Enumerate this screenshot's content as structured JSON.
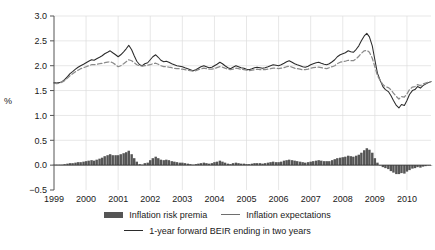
{
  "chart_data": {
    "type": "line",
    "title": "",
    "xlabel": "",
    "ylabel": "%",
    "ylim": [
      -0.5,
      3.0
    ],
    "yticks": [
      "-0.5",
      "0.0",
      "0.5",
      "1.0",
      "1.5",
      "2.0",
      "2.5",
      "3.0"
    ],
    "ytick_values": [
      -0.5,
      0.0,
      0.5,
      1.0,
      1.5,
      2.0,
      2.5,
      3.0
    ],
    "xticks": [
      "1999",
      "2000",
      "2001",
      "2002",
      "2003",
      "2004",
      "2005",
      "2006",
      "2007",
      "2008",
      "2009",
      "2010"
    ],
    "xtick_values": [
      1999,
      2000,
      2001,
      2002,
      2003,
      2004,
      2005,
      2006,
      2007,
      2008,
      2009,
      2010
    ],
    "xlim": [
      1999.0,
      2010.75
    ],
    "grid": true,
    "legend_position": "bottom",
    "colors": {
      "inflation_risk_premia": "#555555",
      "inflation_expectations": "#8a8a8a",
      "beir": "#2b2b2b",
      "grid": "#dcdcdc",
      "axis": "#555555"
    },
    "x": [
      1999.0,
      1999.08,
      1999.17,
      1999.25,
      1999.33,
      1999.42,
      1999.5,
      1999.58,
      1999.67,
      1999.75,
      1999.83,
      1999.92,
      2000.0,
      2000.08,
      2000.17,
      2000.25,
      2000.33,
      2000.42,
      2000.5,
      2000.58,
      2000.67,
      2000.75,
      2000.83,
      2000.92,
      2001.0,
      2001.08,
      2001.17,
      2001.25,
      2001.33,
      2001.42,
      2001.5,
      2001.58,
      2001.67,
      2001.75,
      2001.83,
      2001.92,
      2002.0,
      2002.08,
      2002.17,
      2002.25,
      2002.33,
      2002.42,
      2002.5,
      2002.58,
      2002.67,
      2002.75,
      2002.83,
      2002.92,
      2003.0,
      2003.08,
      2003.17,
      2003.25,
      2003.33,
      2003.42,
      2003.5,
      2003.58,
      2003.67,
      2003.75,
      2003.83,
      2003.92,
      2004.0,
      2004.08,
      2004.17,
      2004.25,
      2004.33,
      2004.42,
      2004.5,
      2004.58,
      2004.67,
      2004.75,
      2004.83,
      2004.92,
      2005.0,
      2005.08,
      2005.17,
      2005.25,
      2005.33,
      2005.42,
      2005.5,
      2005.58,
      2005.67,
      2005.75,
      2005.83,
      2005.92,
      2006.0,
      2006.08,
      2006.17,
      2006.25,
      2006.33,
      2006.42,
      2006.5,
      2006.58,
      2006.67,
      2006.75,
      2006.83,
      2006.92,
      2007.0,
      2007.08,
      2007.17,
      2007.25,
      2007.33,
      2007.42,
      2007.5,
      2007.58,
      2007.67,
      2007.75,
      2007.83,
      2007.92,
      2008.0,
      2008.08,
      2008.17,
      2008.25,
      2008.33,
      2008.42,
      2008.5,
      2008.58,
      2008.67,
      2008.75,
      2008.83,
      2008.92,
      2009.0,
      2009.08,
      2009.17,
      2009.25,
      2009.33,
      2009.42,
      2009.5,
      2009.58,
      2009.67,
      2009.75,
      2009.83,
      2009.92,
      2010.0,
      2010.08,
      2010.17,
      2010.25,
      2010.33,
      2010.42,
      2010.5,
      2010.58,
      2010.67,
      2010.75
    ],
    "series": [
      {
        "name": "1-year forward BEIR ending in two years",
        "style": "solid",
        "color": "#2b2b2b",
        "values": [
          1.66,
          1.65,
          1.66,
          1.68,
          1.72,
          1.78,
          1.84,
          1.88,
          1.93,
          1.97,
          2.0,
          2.03,
          2.06,
          2.09,
          2.12,
          2.11,
          2.14,
          2.17,
          2.2,
          2.24,
          2.27,
          2.3,
          2.26,
          2.22,
          2.18,
          2.22,
          2.28,
          2.34,
          2.41,
          2.32,
          2.2,
          2.09,
          2.02,
          2.0,
          2.04,
          2.06,
          2.12,
          2.18,
          2.22,
          2.17,
          2.11,
          2.08,
          2.09,
          2.07,
          2.04,
          2.02,
          2.0,
          1.99,
          1.98,
          1.96,
          1.94,
          1.92,
          1.9,
          1.92,
          1.95,
          1.98,
          2.0,
          1.98,
          1.96,
          1.97,
          2.0,
          2.03,
          2.07,
          2.04,
          2.0,
          1.96,
          1.94,
          1.97,
          2.0,
          1.98,
          1.96,
          1.95,
          1.93,
          1.92,
          1.94,
          1.96,
          1.97,
          1.96,
          1.95,
          1.96,
          1.98,
          2.0,
          2.02,
          2.01,
          2.0,
          2.02,
          2.05,
          2.08,
          2.1,
          2.07,
          2.04,
          2.02,
          2.0,
          1.98,
          1.97,
          1.99,
          2.02,
          2.04,
          2.06,
          2.07,
          2.05,
          2.03,
          2.02,
          2.04,
          2.08,
          2.12,
          2.18,
          2.22,
          2.24,
          2.26,
          2.3,
          2.28,
          2.27,
          2.33,
          2.4,
          2.5,
          2.6,
          2.65,
          2.58,
          2.4,
          2.12,
          1.85,
          1.7,
          1.58,
          1.52,
          1.48,
          1.4,
          1.3,
          1.2,
          1.15,
          1.22,
          1.2,
          1.3,
          1.42,
          1.5,
          1.52,
          1.58,
          1.55,
          1.6,
          1.63,
          1.66,
          1.68
        ]
      },
      {
        "name": "Inflation expectations",
        "style": "dashed",
        "color": "#8a8a8a",
        "values": [
          1.65,
          1.64,
          1.65,
          1.67,
          1.7,
          1.75,
          1.8,
          1.84,
          1.88,
          1.91,
          1.94,
          1.96,
          1.98,
          2.0,
          2.02,
          2.02,
          2.03,
          2.04,
          2.05,
          2.06,
          2.07,
          2.08,
          2.06,
          2.02,
          1.98,
          2.0,
          2.04,
          2.08,
          2.12,
          2.1,
          2.06,
          2.02,
          2.0,
          1.99,
          2.0,
          2.01,
          2.02,
          2.04,
          2.05,
          2.03,
          2.0,
          1.98,
          1.98,
          1.97,
          1.96,
          1.95,
          1.94,
          1.94,
          1.93,
          1.92,
          1.91,
          1.9,
          1.89,
          1.9,
          1.92,
          1.94,
          1.95,
          1.94,
          1.93,
          1.93,
          1.94,
          1.96,
          1.98,
          1.97,
          1.95,
          1.93,
          1.92,
          1.93,
          1.95,
          1.94,
          1.93,
          1.92,
          1.91,
          1.9,
          1.91,
          1.92,
          1.93,
          1.92,
          1.92,
          1.92,
          1.93,
          1.94,
          1.95,
          1.95,
          1.94,
          1.95,
          1.96,
          1.98,
          1.99,
          1.97,
          1.95,
          1.94,
          1.93,
          1.92,
          1.92,
          1.93,
          1.95,
          1.96,
          1.97,
          1.97,
          1.96,
          1.95,
          1.94,
          1.96,
          1.98,
          2.0,
          2.04,
          2.07,
          2.08,
          2.09,
          2.11,
          2.1,
          2.1,
          2.14,
          2.19,
          2.25,
          2.3,
          2.31,
          2.27,
          2.15,
          1.98,
          1.8,
          1.7,
          1.62,
          1.58,
          1.56,
          1.52,
          1.45,
          1.38,
          1.33,
          1.38,
          1.37,
          1.43,
          1.52,
          1.57,
          1.58,
          1.62,
          1.6,
          1.63,
          1.65,
          1.67,
          1.68
        ]
      }
    ],
    "bar_series": {
      "name": "Inflation risk premia",
      "color": "#555555",
      "values": [
        0.01,
        0.01,
        0.01,
        0.01,
        0.02,
        0.03,
        0.04,
        0.04,
        0.05,
        0.06,
        0.06,
        0.07,
        0.08,
        0.09,
        0.1,
        0.09,
        0.11,
        0.13,
        0.15,
        0.18,
        0.2,
        0.22,
        0.2,
        0.2,
        0.2,
        0.22,
        0.24,
        0.26,
        0.29,
        0.22,
        0.14,
        0.07,
        0.02,
        0.01,
        0.04,
        0.05,
        0.1,
        0.14,
        0.17,
        0.14,
        0.11,
        0.1,
        0.11,
        0.1,
        0.08,
        0.07,
        0.06,
        0.05,
        0.05,
        0.04,
        0.03,
        0.02,
        0.01,
        0.02,
        0.03,
        0.04,
        0.05,
        0.04,
        0.03,
        0.04,
        0.06,
        0.07,
        0.09,
        0.07,
        0.05,
        0.03,
        0.02,
        0.04,
        0.05,
        0.04,
        0.03,
        0.03,
        0.02,
        0.02,
        0.03,
        0.04,
        0.04,
        0.04,
        0.03,
        0.04,
        0.05,
        0.06,
        0.07,
        0.06,
        0.06,
        0.07,
        0.09,
        0.1,
        0.11,
        0.1,
        0.09,
        0.08,
        0.07,
        0.06,
        0.05,
        0.06,
        0.07,
        0.08,
        0.09,
        0.1,
        0.09,
        0.08,
        0.08,
        0.08,
        0.1,
        0.12,
        0.14,
        0.15,
        0.16,
        0.17,
        0.19,
        0.18,
        0.17,
        0.19,
        0.21,
        0.25,
        0.3,
        0.34,
        0.31,
        0.25,
        0.14,
        0.05,
        0.0,
        -0.04,
        -0.06,
        -0.08,
        -0.12,
        -0.15,
        -0.18,
        -0.18,
        -0.16,
        -0.17,
        -0.13,
        -0.1,
        -0.07,
        -0.06,
        -0.04,
        -0.05,
        -0.03,
        -0.02,
        -0.01,
        0.0
      ]
    },
    "legend": [
      {
        "label": "Inflation risk premia",
        "marker": "bar",
        "color": "#555555"
      },
      {
        "label": "Inflation expectations",
        "marker": "line",
        "color": "#8a8a8a"
      },
      {
        "label": "1-year forward BEIR ending in two years",
        "marker": "line-solid",
        "color": "#2b2b2b"
      }
    ]
  }
}
